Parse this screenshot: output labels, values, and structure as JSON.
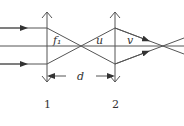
{
  "diagram": {
    "labels": {
      "focal_length": "f₁",
      "object_distance": "u",
      "image_distance": "v",
      "separation": "d"
    },
    "lens_labels": [
      "1",
      "2"
    ],
    "colors": {
      "line": "#555555",
      "text": "#333333",
      "background": "#ffffff"
    }
  }
}
